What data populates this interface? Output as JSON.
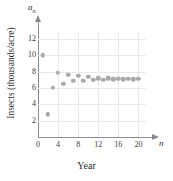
{
  "chart_data": {
    "type": "scatter",
    "title": "",
    "xlabel": "Year",
    "ylabel": "Insects (thousands/acre)",
    "x_axis_symbol": "n",
    "y_axis_symbol": "a",
    "y_axis_subscript": "n",
    "xlim": [
      0,
      21.5
    ],
    "ylim": [
      0,
      13
    ],
    "xticks": [
      0,
      4,
      8,
      12,
      16,
      20
    ],
    "xtick_labels": [
      "0",
      "4",
      "8",
      "12",
      "16",
      "20"
    ],
    "yticks": [
      2,
      4,
      6,
      8,
      10,
      12
    ],
    "ytick_labels": [
      "2",
      "4",
      "6",
      "8",
      "10",
      "12"
    ],
    "grid": true,
    "grid_color": "#e9e9ec",
    "legend": false,
    "marker_color": "#a9a9ad",
    "axis_color": "#8a8a8f",
    "x": [
      1,
      2,
      3,
      4,
      5,
      6,
      7,
      8,
      9,
      10,
      11,
      12,
      13,
      14,
      15,
      16,
      17,
      18,
      19,
      20
    ],
    "values": [
      10.0,
      2.8,
      6.0,
      7.9,
      6.5,
      7.6,
      6.9,
      7.5,
      6.9,
      7.4,
      7.0,
      7.2,
      7.05,
      7.2,
      7.1,
      7.15,
      7.1,
      7.15,
      7.1,
      7.15
    ],
    "points": [
      {
        "n": 1,
        "a": 10.0
      },
      {
        "n": 2,
        "a": 2.8
      },
      {
        "n": 3,
        "a": 6.0
      },
      {
        "n": 4,
        "a": 7.9
      },
      {
        "n": 5,
        "a": 6.5
      },
      {
        "n": 6,
        "a": 7.6
      },
      {
        "n": 7,
        "a": 6.9
      },
      {
        "n": 8,
        "a": 7.5
      },
      {
        "n": 9,
        "a": 6.9
      },
      {
        "n": 10,
        "a": 7.4
      },
      {
        "n": 11,
        "a": 7.0
      },
      {
        "n": 12,
        "a": 7.2
      },
      {
        "n": 13,
        "a": 7.05
      },
      {
        "n": 14,
        "a": 7.2
      },
      {
        "n": 15,
        "a": 7.1
      },
      {
        "n": 16,
        "a": 7.15
      },
      {
        "n": 17,
        "a": 7.1
      },
      {
        "n": 18,
        "a": 7.15
      },
      {
        "n": 19,
        "a": 7.1
      },
      {
        "n": 20,
        "a": 7.15
      }
    ]
  }
}
